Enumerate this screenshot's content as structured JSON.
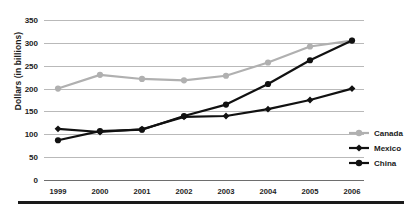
{
  "chart_data": {
    "type": "line",
    "title": "",
    "subtitle": "",
    "xlabel": "",
    "ylabel": "Dollars (in billions)",
    "categories": [
      "1999",
      "2000",
      "2001",
      "2002",
      "2003",
      "2004",
      "2005",
      "2006"
    ],
    "x": [
      1999,
      2000,
      2001,
      2002,
      2003,
      2004,
      2005,
      2006
    ],
    "ylim": [
      0,
      350
    ],
    "yticks": [
      0,
      50,
      100,
      150,
      200,
      250,
      300,
      350
    ],
    "ytick_labels": [
      "0",
      "50",
      "100",
      "150",
      "200",
      "250",
      "300",
      "350"
    ],
    "grid": true,
    "legend_position": "right",
    "series": [
      {
        "name": "Canada",
        "color": "#b0b0b0",
        "marker": "circle",
        "values": [
          200,
          230,
          221,
          218,
          228,
          257,
          292,
          305
        ]
      },
      {
        "name": "Mexico",
        "color": "#111111",
        "marker": "diamond",
        "values": [
          112,
          105,
          111,
          138,
          140,
          155,
          175,
          200
        ]
      },
      {
        "name": "China",
        "color": "#111111",
        "marker": "circle",
        "values": [
          87,
          107,
          110,
          140,
          165,
          210,
          262,
          305
        ]
      }
    ]
  },
  "legend": {
    "items": [
      {
        "label": "Canada"
      },
      {
        "label": "Mexico"
      },
      {
        "label": "China"
      }
    ]
  },
  "colors": {
    "canada": "#b0b0b0",
    "mexico": "#111111",
    "china": "#111111",
    "gridline": "#b9b9b9",
    "axis": "#6e6e6e",
    "rule": "#1a1a1a"
  }
}
